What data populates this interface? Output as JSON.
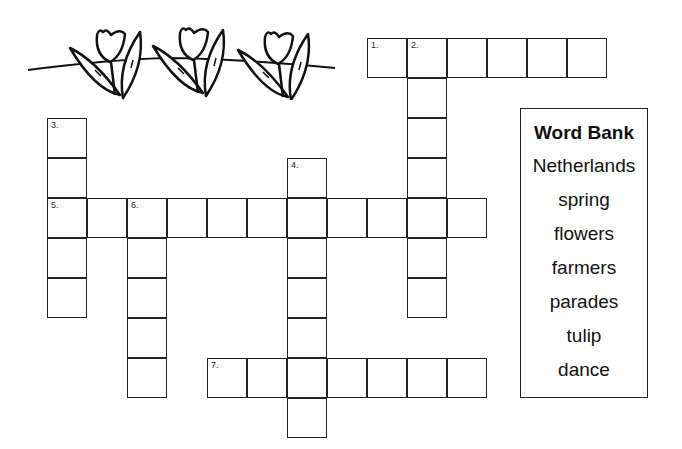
{
  "puzzle": {
    "cell_size": 40,
    "origin": {
      "x": 47,
      "y": 38
    },
    "entries": [
      {
        "number": "1.",
        "direction": "across",
        "row": 0,
        "col": 8,
        "length": 6
      },
      {
        "number": "2.",
        "direction": "down",
        "row": 0,
        "col": 9,
        "length": 7
      },
      {
        "number": "3.",
        "direction": "down",
        "row": 2,
        "col": 0,
        "length": 5
      },
      {
        "number": "4.",
        "direction": "down",
        "row": 3,
        "col": 6,
        "length": 7
      },
      {
        "number": "5.",
        "direction": "across",
        "row": 4,
        "col": 0,
        "length": 11
      },
      {
        "number": "6.",
        "direction": "down",
        "row": 4,
        "col": 2,
        "length": 5
      },
      {
        "number": "7.",
        "direction": "across",
        "row": 8,
        "col": 4,
        "length": 7
      }
    ]
  },
  "word_bank": {
    "title": "Word Bank",
    "words": [
      "Netherlands",
      "spring",
      "flowers",
      "farmers",
      "parades",
      "tulip",
      "dance"
    ]
  },
  "decoration": {
    "icon": "tulip-border-icon",
    "count": 3
  }
}
